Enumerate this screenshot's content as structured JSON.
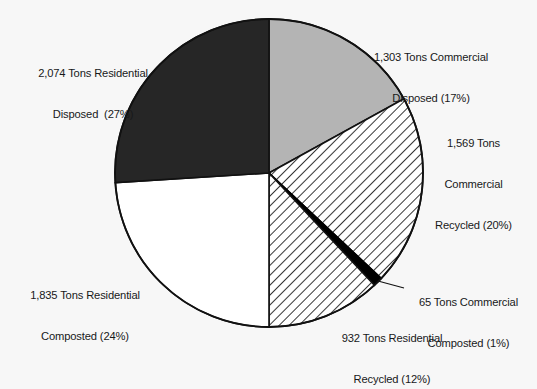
{
  "chart_data": {
    "type": "pie",
    "title": "",
    "subtitle": "",
    "xlabel": "",
    "ylabel": "",
    "legend_position": "none",
    "grid": false,
    "units": "Tons",
    "total_tons": 7778,
    "start_angle_deg": 0,
    "direction": "clockwise",
    "categories": [
      "Commercial Disposed",
      "Commercial Recycled",
      "Commercial Composted",
      "Residential Recycled",
      "Residential Composted",
      "Residential Disposed"
    ],
    "values": [
      1303,
      1569,
      65,
      932,
      1835,
      2074
    ],
    "percentages": [
      17,
      20,
      1,
      12,
      24,
      27
    ],
    "slices": [
      {
        "name": "commercial-disposed",
        "value": 1303,
        "value_text": "1,303",
        "percent": 17,
        "percent_text": "(17%)",
        "fill": "#b4b4b4",
        "pattern": "solid",
        "start_deg": 0,
        "end_deg": 61.2,
        "label_lines": [
          "1,303 Tons Commercial",
          "Disposed (17%)"
        ]
      },
      {
        "name": "commercial-recycled",
        "value": 1569,
        "value_text": "1,569",
        "percent": 20,
        "percent_text": "(20%)",
        "fill": "#ffffff",
        "pattern": "diagonal-hatch",
        "start_deg": 61.2,
        "end_deg": 133.2,
        "label_lines": [
          "1,569 Tons",
          "Commercial",
          "Recycled (20%)"
        ]
      },
      {
        "name": "commercial-composted",
        "value": 65,
        "value_text": "65",
        "percent": 1,
        "percent_text": "(1%)",
        "fill": "#000000",
        "pattern": "solid",
        "start_deg": 133.2,
        "end_deg": 136.8,
        "label_lines": [
          "65 Tons Commercial",
          "Composted (1%)"
        ]
      },
      {
        "name": "residential-recycled",
        "value": 932,
        "value_text": "932",
        "percent": 12,
        "percent_text": "(12%)",
        "fill": "#ffffff",
        "pattern": "diagonal-hatch",
        "start_deg": 136.8,
        "end_deg": 180,
        "label_lines": [
          "932 Tons Residential",
          "Recycled (12%)"
        ]
      },
      {
        "name": "residential-composted",
        "value": 1835,
        "value_text": "1,835",
        "percent": 24,
        "percent_text": "(24%)",
        "fill": "#ffffff",
        "pattern": "solid",
        "start_deg": 180,
        "end_deg": 266.4,
        "label_lines": [
          "1,835 Tons Residential",
          "Composted (24%)"
        ]
      },
      {
        "name": "residential-disposed",
        "value": 2074,
        "value_text": "2,074",
        "percent": 27,
        "percent_text": "(27%)",
        "fill": "#262626",
        "pattern": "solid",
        "start_deg": 266.4,
        "end_deg": 360,
        "label_lines": [
          "2,074 Tons Residential",
          "Disposed  (27%)"
        ]
      }
    ]
  },
  "labels": {
    "commercial_disposed": {
      "line1": "1,303 Tons Commercial",
      "line2": "Disposed (17%)"
    },
    "commercial_recycled": {
      "line1": "1,569 Tons",
      "line2": "Commercial",
      "line3": "Recycled (20%)"
    },
    "commercial_composted": {
      "line1": "65 Tons Commercial",
      "line2": "Composted (1%)"
    },
    "residential_recycled": {
      "line1": "932 Tons Residential",
      "line2": "Recycled (12%)"
    },
    "residential_composted": {
      "line1": "1,835 Tons Residential",
      "line2": "Composted (24%)"
    },
    "residential_disposed": {
      "line1": "2,074 Tons Residential",
      "line2": "Disposed  (27%)"
    }
  },
  "colors": {
    "background": "#f7f7f7",
    "outline": "#111111",
    "text": "#17191a",
    "gray_slice": "#b4b4b4",
    "dark_slice": "#262626",
    "black_slice": "#000000",
    "white_slice": "#ffffff"
  }
}
